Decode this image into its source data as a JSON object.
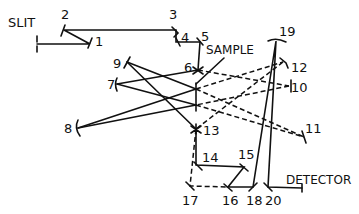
{
  "diagram": {
    "title": "",
    "labels": {
      "slit": "SLIT",
      "sample": "SAMPLE",
      "detector": "DETECTOR"
    },
    "elements": [
      {
        "id": "1",
        "label": "1",
        "x": 90,
        "y": 42
      },
      {
        "id": "2",
        "label": "2",
        "x": 64,
        "y": 30
      },
      {
        "id": "3",
        "label": "3",
        "x": 176,
        "y": 30
      },
      {
        "id": "4",
        "label": "4",
        "x": 180,
        "y": 42
      },
      {
        "id": "5",
        "label": "5",
        "x": 200,
        "y": 42
      },
      {
        "id": "6",
        "label": "6",
        "x": 198,
        "y": 70
      },
      {
        "id": "7",
        "label": "7",
        "x": 117,
        "y": 84
      },
      {
        "id": "8",
        "label": "8",
        "x": 78,
        "y": 128
      },
      {
        "id": "9",
        "label": "9",
        "x": 127,
        "y": 62
      },
      {
        "id": "10",
        "label": "10",
        "x": 289,
        "y": 86
      },
      {
        "id": "11",
        "label": "11",
        "x": 304,
        "y": 137
      },
      {
        "id": "12",
        "label": "12",
        "x": 283,
        "y": 62
      },
      {
        "id": "13",
        "label": "13",
        "x": 196,
        "y": 129
      },
      {
        "id": "14",
        "label": "14",
        "x": 198,
        "y": 165
      },
      {
        "id": "15",
        "label": "15",
        "x": 244,
        "y": 167
      },
      {
        "id": "16",
        "label": "16",
        "x": 228,
        "y": 187
      },
      {
        "id": "17",
        "label": "17",
        "x": 190,
        "y": 186
      },
      {
        "id": "18",
        "label": "18",
        "x": 253,
        "y": 187
      },
      {
        "id": "19",
        "label": "19",
        "x": 276,
        "y": 41
      },
      {
        "id": "20",
        "label": "20",
        "x": 268,
        "y": 187
      }
    ],
    "solid_paths": [
      [
        "slit",
        "1"
      ],
      [
        "1",
        "2"
      ],
      [
        "2",
        "3"
      ],
      [
        "3",
        "4"
      ],
      [
        "4",
        "5"
      ],
      [
        "5",
        "6"
      ],
      [
        "6",
        "7"
      ],
      [
        "7",
        "sample"
      ],
      [
        "sample",
        "8"
      ],
      [
        "8",
        "sample"
      ],
      [
        "sample",
        "9"
      ],
      [
        "9",
        "13"
      ],
      [
        "13",
        "14"
      ],
      [
        "14",
        "15"
      ],
      [
        "15",
        "16"
      ],
      [
        "16",
        "18"
      ],
      [
        "18",
        "19"
      ],
      [
        "19",
        "20"
      ],
      [
        "20",
        "detector"
      ]
    ],
    "dashed_paths": [
      [
        "6",
        "10"
      ],
      [
        "sample",
        "12"
      ],
      [
        "12",
        "sample"
      ],
      [
        "sample",
        "11"
      ],
      [
        "10",
        "sample"
      ],
      [
        "sample",
        "13"
      ],
      [
        "13",
        "17"
      ],
      [
        "17",
        "16"
      ]
    ]
  }
}
